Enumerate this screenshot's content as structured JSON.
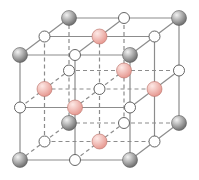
{
  "title": "Rock-salt (NaCl) type cubic crystal lattice",
  "lattice": {
    "size": 3,
    "origin": [
      20,
      55
    ],
    "step_x": 55,
    "step_y": 52.5,
    "depth_dx": 24.5,
    "depth_dy": -18.5
  },
  "styles": {
    "line_color": "#8c8c8c",
    "line_width": 1.2,
    "dash": "4,3",
    "atom_types": {
      "gray": {
        "fill_light": "#f2f2f2",
        "fill_dark": "#707070",
        "stroke": "#5e5e5e",
        "radius": 7.5
      },
      "pink": {
        "fill_light": "#fde9e6",
        "fill_dark": "#e79a92",
        "stroke": "#b96e67",
        "radius": 7.5
      },
      "white": {
        "fill_light": "#ffffff",
        "fill_dark": "#ffffff",
        "stroke": "#555555",
        "radius": 5.5
      }
    }
  },
  "legend": {
    "corner_atoms": "gray",
    "face_center_atoms": "pink",
    "edge_center_atoms": "white",
    "body_center_atom": "white"
  }
}
